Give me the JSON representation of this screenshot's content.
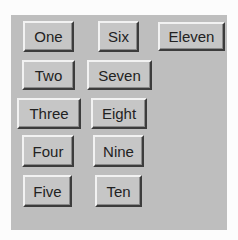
{
  "panel": {
    "background": "#bebebe",
    "buttons": [
      {
        "label": "One"
      },
      {
        "label": "Two"
      },
      {
        "label": "Three"
      },
      {
        "label": "Four"
      },
      {
        "label": "Five"
      },
      {
        "label": "Six"
      },
      {
        "label": "Seven"
      },
      {
        "label": "Eight"
      },
      {
        "label": "Nine"
      },
      {
        "label": "Ten"
      },
      {
        "label": "Eleven"
      }
    ]
  }
}
